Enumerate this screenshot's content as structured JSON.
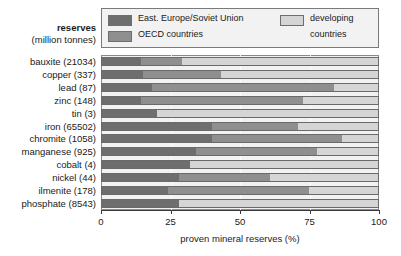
{
  "header": {
    "reserves_title": "reserves",
    "reserves_units": "(million tonnes)"
  },
  "legend": {
    "entries": [
      {
        "label": "East. Europe/Soviet Union",
        "color": "#6e6e6e"
      },
      {
        "label": "OECD countries",
        "color": "#8f8f8f"
      },
      {
        "label": "developing",
        "color": "#d5d5d5"
      },
      {
        "label": "countries",
        "color": "#d5d5d5"
      }
    ]
  },
  "axis": {
    "x_title": "proven mineral reserves (%)",
    "x_ticks": [
      "0",
      "25",
      "50",
      "75",
      "100"
    ]
  },
  "chart_data": {
    "type": "bar",
    "orientation": "horizontal",
    "stacked": true,
    "title": "",
    "xlabel": "proven mineral reserves (%)",
    "ylabel": "reserves (million tonnes)",
    "xlim": [
      0,
      100
    ],
    "xticks": [
      0,
      25,
      50,
      75,
      100
    ],
    "grid": true,
    "legend_position": "top",
    "categories": [
      "bauxite (21034)",
      "copper (337)",
      "lead (87)",
      "zinc (148)",
      "tin (3)",
      "iron (65502)",
      "chromite (1058)",
      "manganese (925)",
      "cobalt (4)",
      "nickel (44)",
      "ilmenite (178)",
      "phosphate (8543)"
    ],
    "series": [
      {
        "name": "East. Europe/Soviet Union",
        "color": "#6e6e6e",
        "values": [
          14,
          15,
          18,
          14,
          20,
          40,
          40,
          34,
          32,
          28,
          24,
          28
        ]
      },
      {
        "name": "OECD countries",
        "color": "#8f8f8f",
        "values": [
          15,
          28,
          66,
          59,
          0,
          31,
          47,
          44,
          0,
          33,
          51,
          0
        ]
      },
      {
        "name": "developing countries",
        "color": "#d5d5d5",
        "values": [
          71,
          57,
          16,
          27,
          80,
          29,
          13,
          22,
          68,
          39,
          25,
          72
        ]
      }
    ]
  }
}
